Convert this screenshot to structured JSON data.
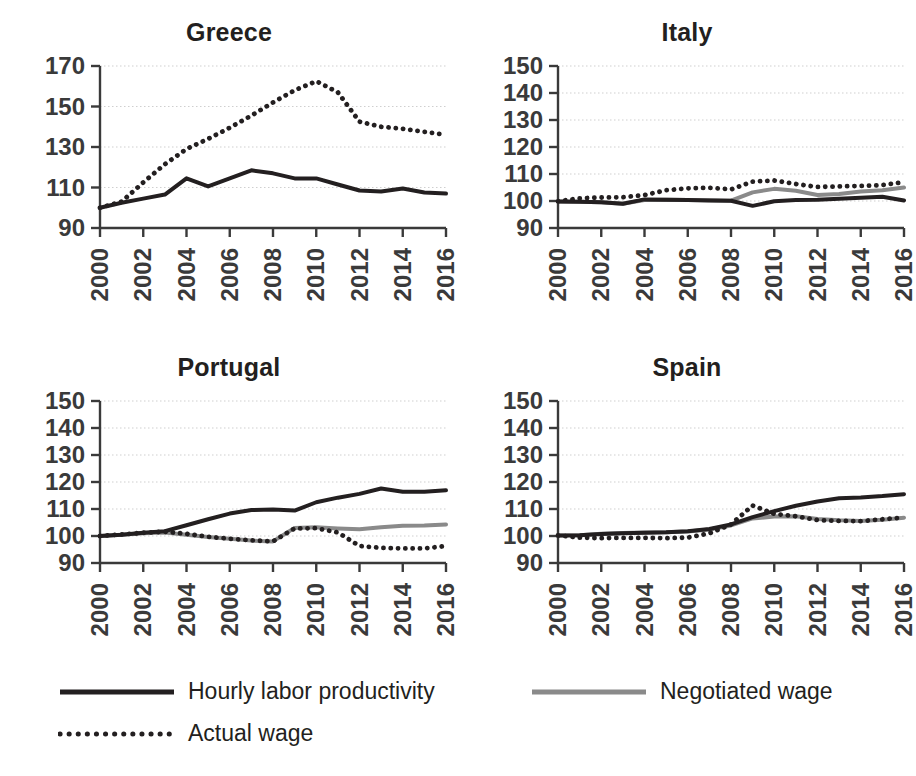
{
  "figure": {
    "background": "#ffffff",
    "text_color": "#231f20"
  },
  "colors": {
    "productivity": "#231f20",
    "negotiated_wage": "#8a8a8a",
    "actual_wage": "#231f20",
    "grid": "#cfcfcf",
    "axis": "#3a3a3a"
  },
  "legend": {
    "items": [
      {
        "label": "Hourly labor productivity",
        "style": "solid",
        "color": "#231f20",
        "width": 5
      },
      {
        "label": "Negotiated wage",
        "style": "solid",
        "color": "#8a8a8a",
        "width": 5
      },
      {
        "label": "Actual wage",
        "style": "dotted",
        "color": "#231f20",
        "width": 5
      }
    ]
  },
  "chart_data": [
    {
      "type": "line",
      "title": "Greece",
      "xlabel": "",
      "ylabel": "",
      "xlim": [
        2000,
        2016
      ],
      "ylim": [
        90,
        170
      ],
      "yticks": [
        90,
        110,
        130,
        150,
        170
      ],
      "xticks": [
        2000,
        2002,
        2004,
        2006,
        2008,
        2010,
        2012,
        2014,
        2016
      ],
      "xticklabels": [
        "2000",
        "2002",
        "2004",
        "2006",
        "2008",
        "2010",
        "2012",
        "2014",
        "2016"
      ],
      "grid": true,
      "legend_position": "below-figure",
      "x": [
        2000,
        2001,
        2002,
        2003,
        2004,
        2005,
        2006,
        2007,
        2008,
        2009,
        2010,
        2011,
        2012,
        2013,
        2014,
        2015,
        2016
      ],
      "series": [
        {
          "name": "Hourly labor productivity",
          "style": "solid",
          "color": "#231f20",
          "values": [
            100.0,
            102.5,
            104.5,
            106.5,
            114.5,
            110.5,
            114.5,
            118.5,
            117.0,
            114.5,
            114.5,
            111.5,
            108.5,
            108.0,
            109.5,
            107.5,
            107.0
          ]
        },
        {
          "name": "Actual wage",
          "style": "dotted",
          "color": "#231f20",
          "values": [
            100.0,
            103.0,
            112.5,
            121.5,
            129.0,
            134.0,
            139.5,
            145.5,
            152.0,
            158.0,
            162.5,
            157.0,
            142.5,
            140.0,
            139.0,
            137.5,
            136.0
          ]
        }
      ]
    },
    {
      "type": "line",
      "title": "Italy",
      "xlabel": "",
      "ylabel": "",
      "xlim": [
        2000,
        2016
      ],
      "ylim": [
        90,
        150
      ],
      "yticks": [
        90,
        100,
        110,
        120,
        130,
        140,
        150
      ],
      "xticks": [
        2000,
        2002,
        2004,
        2006,
        2008,
        2010,
        2012,
        2014,
        2016
      ],
      "xticklabels": [
        "2000",
        "2002",
        "2004",
        "2006",
        "2008",
        "2010",
        "2012",
        "2014",
        "2016"
      ],
      "grid": true,
      "legend_position": "below-figure",
      "x": [
        2000,
        2001,
        2002,
        2003,
        2004,
        2005,
        2006,
        2007,
        2008,
        2009,
        2010,
        2011,
        2012,
        2013,
        2014,
        2015,
        2016
      ],
      "series": [
        {
          "name": "Hourly labor productivity",
          "style": "solid",
          "color": "#231f20",
          "values": [
            99.8,
            99.7,
            99.5,
            99.0,
            100.6,
            100.5,
            100.4,
            100.2,
            100.1,
            98.2,
            99.9,
            100.4,
            100.5,
            100.8,
            101.2,
            101.6,
            100.2
          ]
        },
        {
          "name": "Negotiated wage",
          "style": "solid",
          "color": "#8a8a8a",
          "values": [
            99.8,
            99.7,
            99.5,
            99.0,
            100.4,
            100.5,
            100.4,
            100.3,
            100.1,
            103.2,
            104.5,
            103.8,
            102.2,
            102.6,
            103.5,
            104.0,
            105.0
          ]
        },
        {
          "name": "Actual wage",
          "style": "dotted",
          "color": "#231f20",
          "values": [
            99.9,
            101.0,
            101.3,
            101.4,
            102.2,
            104.0,
            104.7,
            104.9,
            104.3,
            107.2,
            107.6,
            106.3,
            105.2,
            105.4,
            105.6,
            105.9,
            107.0
          ]
        }
      ]
    },
    {
      "type": "line",
      "title": "Portugal",
      "xlabel": "",
      "ylabel": "",
      "xlim": [
        2000,
        2016
      ],
      "ylim": [
        90,
        150
      ],
      "yticks": [
        90,
        100,
        110,
        120,
        130,
        140,
        150
      ],
      "xticks": [
        2000,
        2002,
        2004,
        2006,
        2008,
        2010,
        2012,
        2014,
        2016
      ],
      "xticklabels": [
        "2000",
        "2002",
        "2004",
        "2006",
        "2008",
        "2010",
        "2012",
        "2014",
        "2016"
      ],
      "grid": true,
      "legend_position": "below-figure",
      "x": [
        2000,
        2001,
        2002,
        2003,
        2004,
        2005,
        2006,
        2007,
        2008,
        2009,
        2010,
        2011,
        2012,
        2013,
        2014,
        2015,
        2016
      ],
      "series": [
        {
          "name": "Hourly labor productivity",
          "style": "solid",
          "color": "#231f20",
          "values": [
            100.0,
            100.5,
            101.2,
            101.8,
            104.0,
            106.2,
            108.3,
            109.6,
            109.8,
            109.4,
            112.5,
            114.2,
            115.6,
            117.6,
            116.4,
            116.4,
            116.9
          ]
        },
        {
          "name": "Negotiated wage",
          "style": "solid",
          "color": "#8a8a8a",
          "values": [
            100.0,
            100.5,
            101.0,
            101.3,
            100.5,
            99.6,
            99.0,
            98.3,
            98.0,
            103.0,
            103.2,
            102.8,
            102.5,
            103.2,
            103.8,
            103.9,
            104.3
          ]
        },
        {
          "name": "Actual wage",
          "style": "dotted",
          "color": "#231f20",
          "values": [
            100.0,
            100.6,
            101.2,
            101.6,
            100.8,
            99.7,
            99.0,
            98.4,
            98.0,
            102.8,
            102.9,
            101.3,
            96.3,
            95.6,
            95.4,
            95.4,
            96.3
          ]
        }
      ]
    },
    {
      "type": "line",
      "title": "Spain",
      "xlabel": "",
      "ylabel": "",
      "xlim": [
        2000,
        2016
      ],
      "ylim": [
        90,
        150
      ],
      "yticks": [
        90,
        100,
        110,
        120,
        130,
        140,
        150
      ],
      "xticks": [
        2000,
        2002,
        2004,
        2006,
        2008,
        2010,
        2012,
        2014,
        2016
      ],
      "xticklabels": [
        "2000",
        "2002",
        "2004",
        "2006",
        "2008",
        "2010",
        "2012",
        "2014",
        "2016"
      ],
      "grid": true,
      "legend_position": "below-figure",
      "x": [
        2000,
        2001,
        2002,
        2003,
        2004,
        2005,
        2006,
        2007,
        2008,
        2009,
        2010,
        2011,
        2012,
        2013,
        2014,
        2015,
        2016
      ],
      "series": [
        {
          "name": "Hourly labor productivity",
          "style": "solid",
          "color": "#231f20",
          "values": [
            100.2,
            100.3,
            100.7,
            101.0,
            101.2,
            101.4,
            101.8,
            102.6,
            104.3,
            107.0,
            109.2,
            111.2,
            112.8,
            114.0,
            114.3,
            114.8,
            115.5
          ]
        },
        {
          "name": "Negotiated wage",
          "style": "solid",
          "color": "#8a8a8a",
          "values": [
            100.2,
            100.3,
            100.8,
            101.1,
            101.3,
            101.4,
            101.7,
            102.4,
            103.9,
            106.5,
            107.2,
            107.3,
            106.3,
            105.8,
            105.6,
            106.0,
            106.8
          ]
        },
        {
          "name": "Actual wage",
          "style": "dotted",
          "color": "#231f20",
          "values": [
            100.2,
            99.4,
            99.2,
            99.3,
            99.3,
            99.2,
            99.4,
            101.0,
            104.3,
            111.3,
            108.2,
            107.3,
            105.9,
            105.6,
            105.5,
            106.2,
            106.8
          ]
        }
      ]
    }
  ]
}
